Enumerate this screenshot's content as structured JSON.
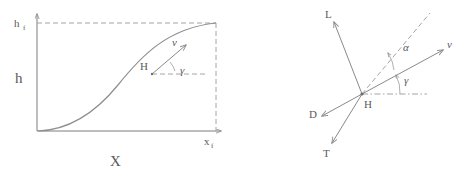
{
  "figure": {
    "stroke_color": "#8e8e8e",
    "text_color": "#5a5a5a"
  },
  "left_panel": {
    "name": "trajectory-plot",
    "y_axis_label": "h",
    "y_axis_top_label_base": "h",
    "y_axis_top_label_sub": "f",
    "x_axis_label": "X",
    "x_axis_end_label_base": "x",
    "x_axis_end_label_sub": "f",
    "point_label": "H",
    "velocity_label": "v",
    "angle_label": "γ",
    "description": "S-shaped climb trajectory from origin to final altitude h_f at range x_f",
    "trajectory_points": [
      {
        "x": 0.0,
        "h": 0.0
      },
      {
        "x": 0.12,
        "h": 0.03
      },
      {
        "x": 0.25,
        "h": 0.12
      },
      {
        "x": 0.4,
        "h": 0.3
      },
      {
        "x": 0.55,
        "h": 0.52
      },
      {
        "x": 0.7,
        "h": 0.74
      },
      {
        "x": 0.85,
        "h": 0.91
      },
      {
        "x": 1.0,
        "h": 1.0
      }
    ]
  },
  "right_panel": {
    "name": "force-diagram",
    "origin_label": "H",
    "vectors": [
      {
        "name": "lift",
        "label": "L"
      },
      {
        "name": "drag",
        "label": "D"
      },
      {
        "name": "thrust",
        "label": "T"
      },
      {
        "name": "velocity",
        "label": "v"
      }
    ],
    "angles": [
      {
        "name": "angle-of-attack",
        "label": "α"
      },
      {
        "name": "flight-path-angle",
        "label": "γ"
      }
    ]
  }
}
